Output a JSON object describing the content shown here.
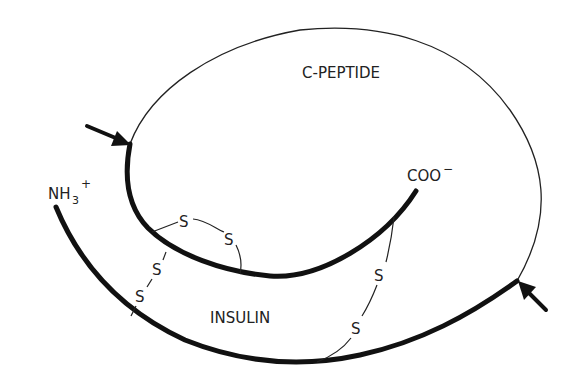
{
  "diagram": {
    "labels": {
      "c_peptide": "C-PEPTIDE",
      "insulin": "INSULIN",
      "n_terminus": "NH",
      "n_terminus_sub": "3",
      "n_terminus_sup": "+",
      "c_terminus": "COO",
      "c_terminus_sup": "−"
    },
    "disulfide": {
      "atom": "S"
    },
    "nodes": [
      {
        "id": "c_peptide_loop",
        "kind": "thin chain",
        "label": "C-PEPTIDE"
      },
      {
        "id": "b_chain",
        "kind": "thick chain",
        "end_label": "COO−"
      },
      {
        "id": "a_chain",
        "kind": "thick chain",
        "end_label": "NH3+"
      },
      {
        "id": "intra_chain_bridge",
        "kind": "disulfide bond",
        "label": "S–S"
      },
      {
        "id": "inter_chain_bridge_left",
        "kind": "disulfide bond",
        "label": "S–S"
      },
      {
        "id": "inter_chain_bridge_right",
        "kind": "disulfide bond",
        "label": "S–S"
      },
      {
        "id": "cleavage_arrow_upper_left",
        "kind": "arrow"
      },
      {
        "id": "cleavage_arrow_lower_right",
        "kind": "arrow"
      }
    ],
    "colors": {
      "ink": "#111111",
      "text": "#222222",
      "background": "#ffffff"
    }
  }
}
